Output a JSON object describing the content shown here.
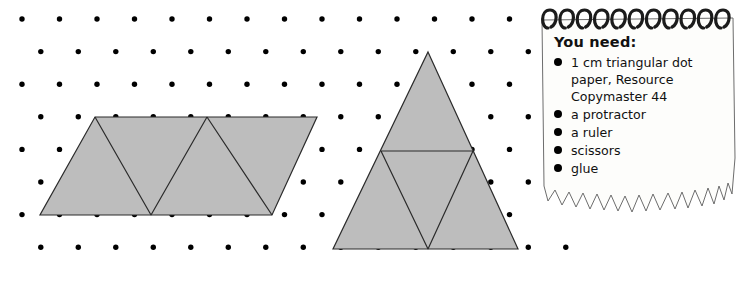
{
  "page": {
    "background_color": "#ffffff",
    "dot_color": "#000000",
    "shape_fill": "#bdbdbd",
    "shape_stroke": "#2b2b2b"
  },
  "figures": {
    "left_shape": {
      "name": "parallelogram-of-four-triangles",
      "description": "Grey parallelogram divided into four equilateral triangles on triangular dot paper"
    },
    "right_shape": {
      "name": "large-triangle-with-inner-triangle",
      "description": "Grey equilateral triangle divided into four smaller equilateral triangles on triangular dot paper"
    }
  },
  "notepad": {
    "title": "You need:",
    "items": [
      "1 cm triangular dot paper, Resource Copymaster 44",
      "a protractor",
      "a ruler",
      "scissors",
      "glue"
    ],
    "paper_color": "#fdfdfb",
    "spiral_color": "#1b1b1b"
  }
}
